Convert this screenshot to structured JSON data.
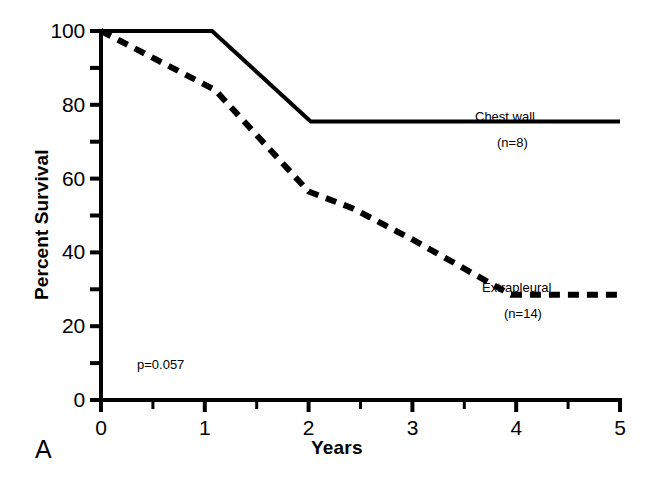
{
  "panel": {
    "letter": "A"
  },
  "chart_data": {
    "type": "line",
    "title": "",
    "subtitle": "",
    "xlabel": "Years",
    "ylabel": "Percent Survival",
    "xlim": [
      0,
      5
    ],
    "ylim": [
      0,
      100
    ],
    "xticks": [
      0,
      1,
      2,
      3,
      4,
      5
    ],
    "xtick_labels": [
      "0",
      "1",
      "2",
      "3",
      "4",
      "5"
    ],
    "xminor_ticks": [
      0.5,
      1.5,
      2.5,
      3.5,
      4.5
    ],
    "yticks": [
      0,
      20,
      40,
      60,
      80,
      100
    ],
    "ytick_labels": [
      "0",
      "20",
      "40",
      "60",
      "80",
      "100"
    ],
    "yminor_ticks": [
      10,
      30,
      50,
      70,
      90
    ],
    "grid": false,
    "legend_position": "inline-at-curve-end",
    "annotations": [
      {
        "name": "p-value",
        "text": "p=0.057",
        "x": 0.35,
        "y": 9.5
      }
    ],
    "series": [
      {
        "name": "Chest wall",
        "label": "Chest wall",
        "sublabel": "(n=8)",
        "n": 8,
        "style": "solid",
        "color": "#000000",
        "label_x": 4.0,
        "label_y": 80.5,
        "x": [
          0,
          1.07,
          2.02,
          5
        ],
        "y": [
          100,
          100,
          75.5,
          75.5
        ]
      },
      {
        "name": "Extrapleural",
        "label": "Extrapleural",
        "sublabel": "(n=14)",
        "n": 14,
        "style": "dashed",
        "color": "#000000",
        "label_x": 4.02,
        "label_y": 33.5,
        "x": [
          0,
          1.1,
          2.0,
          2.42,
          3.0,
          3.95,
          5
        ],
        "y": [
          100,
          84,
          56.5,
          52,
          43.5,
          28.5,
          28.5
        ]
      }
    ]
  }
}
